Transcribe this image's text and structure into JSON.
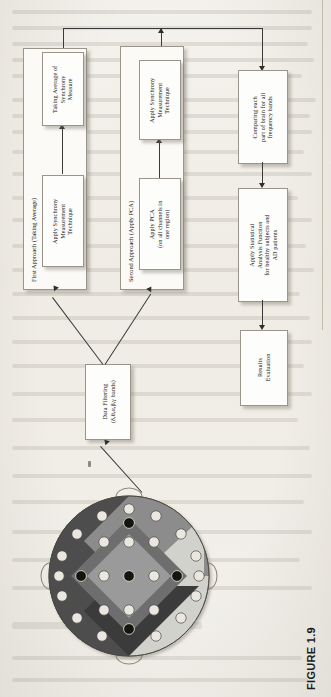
{
  "figure": {
    "caption": "FIGURE 1.9",
    "orientation_deg": 90,
    "source_box": {
      "label": "Data Filtering\n(δ,θ,α,β,γ bands)"
    },
    "groups": [
      {
        "id": "first-approach",
        "label": "First Approach (Taking Average)",
        "steps": [
          {
            "id": "apply-synchrony-1",
            "label": "Apply Synchrony\nMeasurement\nTechnique"
          },
          {
            "id": "taking-average",
            "label": "Taking Average of\nSynchrony\nMeasure"
          }
        ]
      },
      {
        "id": "second-approach",
        "label": "Second Approach (Apply PCA)",
        "steps": [
          {
            "id": "apply-pca",
            "label": "Apply PCA\n(on all channels in\none region)"
          },
          {
            "id": "apply-synchrony-2",
            "label": "Apply Synchrony\nMeasurement\nTechnique"
          }
        ]
      }
    ],
    "pipeline": [
      {
        "id": "comparing",
        "label": "Comparing each\npart of brain for all\nfrequency bands"
      },
      {
        "id": "statistical",
        "label": "Apply Statistical\nAnalysis Function\nfor healthy subjects and\nAD patients"
      },
      {
        "id": "results",
        "label": "Results\nEvaluation"
      }
    ],
    "head_diagram": {
      "name": "eeg-electrode-head-map",
      "regions": [
        {
          "name": "left-region",
          "color": "#4d4d4d"
        },
        {
          "name": "anterior-region",
          "color": "#8c8c8c"
        },
        {
          "name": "right-region",
          "color": "#d2d2cc"
        },
        {
          "name": "posterior-region",
          "color": "#3a3a3a"
        },
        {
          "name": "central-region",
          "color": "#6e6e6e"
        },
        {
          "name": "central-inner",
          "color": "#9a9a9a"
        }
      ],
      "electrodes_light": 21,
      "electrodes_dark": 5
    }
  },
  "page_bleed": {
    "heading": "SYNCHRONY MEASU",
    "note": "faint show-through text from the underlying book page"
  }
}
